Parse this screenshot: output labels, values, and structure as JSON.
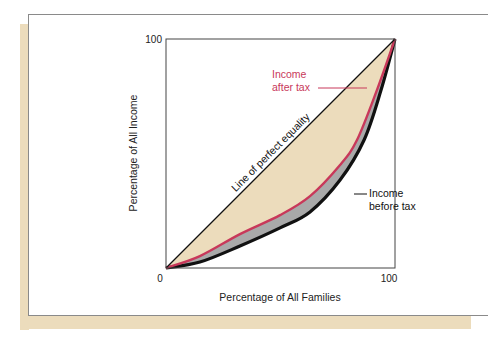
{
  "chart_data": {
    "type": "line",
    "title": "",
    "xlabel": "Percentage of All Families",
    "ylabel": "Percentage of All Income",
    "xlim": [
      0,
      100
    ],
    "ylim": [
      0,
      100
    ],
    "x_ticks": [
      "0",
      "100"
    ],
    "y_ticks": [
      "0",
      "100"
    ],
    "grid": false,
    "legend": "inline annotations",
    "series": [
      {
        "name": "Line of perfect equality",
        "color": "#111111",
        "x": [
          0,
          100
        ],
        "y": [
          0,
          100
        ]
      },
      {
        "name": "Income after tax",
        "color": "#c8385a",
        "x": [
          0,
          14.8,
          32.3,
          49.8,
          62.9,
          76,
          83.4,
          92.1,
          100
        ],
        "y": [
          0,
          5.2,
          14.8,
          23.1,
          31.4,
          45,
          55.9,
          77.7,
          100
        ]
      },
      {
        "name": "Income before tax",
        "color": "#111111",
        "x": [
          0,
          14.8,
          32.3,
          49.8,
          62.9,
          76,
          86.5,
          93.9,
          100
        ],
        "y": [
          0,
          2.6,
          9.6,
          17.5,
          24.5,
          38.4,
          55.9,
          77.7,
          100
        ]
      }
    ],
    "fills": [
      {
        "between": [
          "Line of perfect equality",
          "Income after tax"
        ],
        "color": "#ecdcbc"
      },
      {
        "between": [
          "Income after tax",
          "Income before tax"
        ],
        "color": "#a9a9a9"
      }
    ],
    "annotations": {
      "equality_label": "Line of perfect equality",
      "after_tax_line1": "Income",
      "after_tax_line2": "after tax",
      "before_tax_line1": "Income",
      "before_tax_line2": "before tax"
    }
  },
  "axis": {
    "x_min": "0",
    "x_max": "100",
    "y_min": "0",
    "y_max": "100",
    "x_title": "Percentage of All Families",
    "y_title": "Percentage of All Income"
  },
  "colors": {
    "beige": "#ecdcbc",
    "after_tax": "#c8385a",
    "before_tax": "#111111",
    "gap": "#a9a9a9"
  }
}
